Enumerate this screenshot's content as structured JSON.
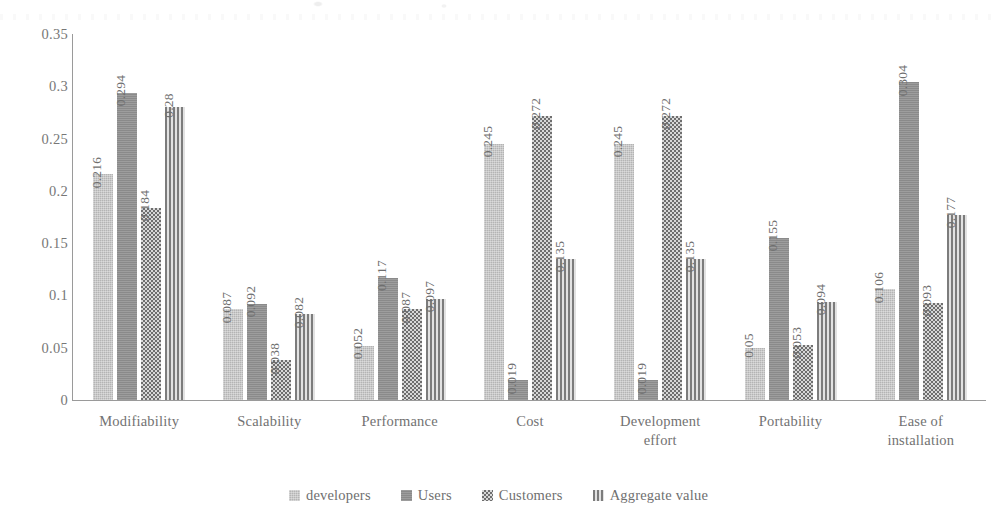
{
  "chart_data": {
    "type": "bar",
    "title": "",
    "subtitle": "",
    "xlabel": "",
    "ylabel": "",
    "ylim": [
      0,
      0.35
    ],
    "grid": false,
    "legend_position": "bottom",
    "y_ticks": [
      "0.35",
      "0.3",
      "0.25",
      "0.2",
      "0.15",
      "0.1",
      "0.05",
      "0"
    ],
    "y_tick_values": [
      0.35,
      0.3,
      0.25,
      0.2,
      0.15,
      0.1,
      0.05,
      0
    ],
    "categories": [
      "Modifiability",
      "Scalability",
      "Performance",
      "Cost",
      "Development effort",
      "Portability",
      "Ease of installation"
    ],
    "category_lines": [
      [
        "Modifiability"
      ],
      [
        "Scalability"
      ],
      [
        "Performance"
      ],
      [
        "Cost"
      ],
      [
        "Development",
        "effort"
      ],
      [
        "Portability"
      ],
      [
        "Ease of",
        "installation"
      ]
    ],
    "series": [
      {
        "name": "developers",
        "pattern": "light-gray-solid",
        "color": "#b4b4b4",
        "values": [
          0.216,
          0.087,
          0.052,
          0.245,
          0.245,
          0.05,
          0.106
        ],
        "labels": [
          "0.216",
          "0.087",
          "0.052",
          "0.245",
          "0.245",
          "0.05",
          "0.106"
        ]
      },
      {
        "name": "Users",
        "pattern": "dark-gray-solid",
        "color": "#8a8a8a",
        "values": [
          0.294,
          0.092,
          0.117,
          0.019,
          0.019,
          0.155,
          0.304
        ],
        "labels": [
          "0.294",
          "0.092",
          "0.117",
          "0.019",
          "0.019",
          "0.155",
          "0.304"
        ]
      },
      {
        "name": "Customers",
        "pattern": "checkerboard",
        "color": "#8f8f8f",
        "values": [
          0.184,
          0.038,
          0.087,
          0.272,
          0.272,
          0.053,
          0.093
        ],
        "labels": [
          "0.184",
          "0.038",
          "0.087",
          "0.272",
          "0.272",
          "0.053",
          "0.093"
        ]
      },
      {
        "name": "Aggregate value",
        "pattern": "vertical-stripes",
        "color": "#d2d2d2",
        "values": [
          0.28,
          0.082,
          0.097,
          0.135,
          0.135,
          0.094,
          0.177
        ],
        "labels": [
          "0.28",
          "0.082",
          "0.097",
          "0.135",
          "0.135",
          "0.094",
          "0.177"
        ]
      }
    ]
  }
}
